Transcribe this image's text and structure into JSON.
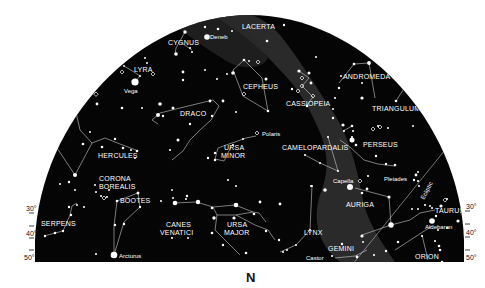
{
  "map": {
    "title": "Northern sky chart",
    "direction_label": "N",
    "colors": {
      "sky": "#050505",
      "milky_way": "#3a3a3a",
      "stars": "#ffffff",
      "lines": "#cfcfcf",
      "paper": "#ffffff",
      "ink": "#111111"
    },
    "latitude_ticks_left": [
      "30°",
      "40°",
      "50°"
    ],
    "latitude_ticks_right": [
      "30°",
      "40°",
      "50°"
    ],
    "ecliptic_label": "Ecliptic",
    "constellations": [
      {
        "name": "LACERTA",
        "x": 252,
        "y": 29
      },
      {
        "name": "CYGNUS",
        "x": 168,
        "y": 45
      },
      {
        "name": "LYRA",
        "x": 133,
        "y": 72
      },
      {
        "name": "CEPHEUS",
        "x": 243,
        "y": 89
      },
      {
        "name": "ANDROMEDA",
        "x": 343,
        "y": 79
      },
      {
        "name": "CASSIOPEIA",
        "x": 286,
        "y": 106
      },
      {
        "name": "TRIANGULUM",
        "x": 372,
        "y": 110
      },
      {
        "name": "DRACO",
        "x": 180,
        "y": 115
      },
      {
        "name": "URSA",
        "x": 222,
        "y": 150
      },
      {
        "name": "MINOR",
        "x": 222,
        "y": 158
      },
      {
        "name": "PERSEUS",
        "x": 364,
        "y": 147
      },
      {
        "name": "CAMELOPARDALIS",
        "x": 283,
        "y": 149
      },
      {
        "name": "HERCULES",
        "x": 98,
        "y": 158
      },
      {
        "name": "CORONA",
        "x": 99,
        "y": 181
      },
      {
        "name": "BOREALIS",
        "x": 99,
        "y": 189
      },
      {
        "name": "BOOTES",
        "x": 120,
        "y": 203
      },
      {
        "name": "AURIGA",
        "x": 347,
        "y": 206
      },
      {
        "name": "TAURUS",
        "x": 445,
        "y": 213
      },
      {
        "name": "SERPENS",
        "x": 40,
        "y": 226
      },
      {
        "name": "CANES",
        "x": 181,
        "y": 227
      },
      {
        "name": "VENATICI",
        "x": 181,
        "y": 235
      },
      {
        "name": "URSA",
        "x": 240,
        "y": 227
      },
      {
        "name": "MAJOR",
        "x": 240,
        "y": 235
      },
      {
        "name": "LYNX",
        "x": 303,
        "y": 235
      },
      {
        "name": "GEMINI",
        "x": 331,
        "y": 251
      },
      {
        "name": "ORION",
        "x": 427,
        "y": 258
      }
    ],
    "named_stars": [
      {
        "name": "Deneb",
        "x": 211,
        "y": 37
      },
      {
        "name": "Vega",
        "x": 124,
        "y": 90
      },
      {
        "name": "Polaris",
        "x": 259,
        "y": 134
      },
      {
        "name": "Capella",
        "x": 339,
        "y": 181
      },
      {
        "name": "Pleiades",
        "x": 384,
        "y": 178
      },
      {
        "name": "Aldebaran",
        "x": 440,
        "y": 226
      },
      {
        "name": "Arcturus",
        "x": 118,
        "y": 256
      },
      {
        "name": "Castor",
        "x": 306,
        "y": 258
      }
    ]
  }
}
